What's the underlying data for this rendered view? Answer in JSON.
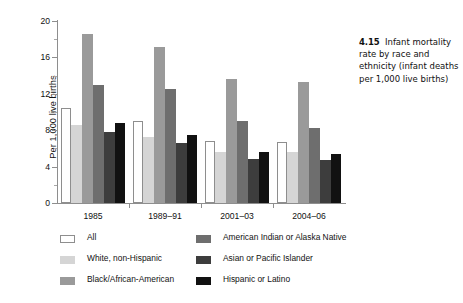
{
  "caption": {
    "number": "4.15",
    "text": "Infant mortality rate by race and ethnicity (infant deaths per 1,000 live births)"
  },
  "axis": {
    "ylabel": "Per 1,000 live births",
    "yticks": [
      "0",
      "4",
      "8",
      "12",
      "16",
      "20"
    ]
  },
  "legend": {
    "items": [
      {
        "label": "All",
        "color": "#ffffff"
      },
      {
        "label": "White, non-Hispanic",
        "color": "#d5d5d5"
      },
      {
        "label": "Black/African-American",
        "color": "#9a9a9a"
      },
      {
        "label": "American Indian or Alaska Native",
        "color": "#6e6e6e"
      },
      {
        "label": "Asian or Pacific Islander",
        "color": "#3d3d3d"
      },
      {
        "label": "Hispanic or Latino",
        "color": "#111111"
      }
    ]
  },
  "chart_data": {
    "type": "bar",
    "title": "Infant mortality rate by race and ethnicity (infant deaths per 1,000 live births)",
    "xlabel": "",
    "ylabel": "Per 1,000 live births",
    "ylim": [
      0,
      20
    ],
    "ytick_step": 4,
    "grid": false,
    "legend_position": "below-plot",
    "categories": [
      "1985",
      "1989–91",
      "2001–03",
      "2004–06"
    ],
    "series": [
      {
        "name": "All",
        "color": "#ffffff",
        "values": [
          10.4,
          9.0,
          6.8,
          6.7
        ]
      },
      {
        "name": "White, non-Hispanic",
        "color": "#d5d5d5",
        "values": [
          8.6,
          7.3,
          5.6,
          5.6
        ]
      },
      {
        "name": "Black/African-American",
        "color": "#9a9a9a",
        "values": [
          18.6,
          17.1,
          13.6,
          13.3
        ]
      },
      {
        "name": "American Indian or Alaska Native",
        "color": "#6e6e6e",
        "values": [
          13.0,
          12.5,
          9.0,
          8.2
        ]
      },
      {
        "name": "Asian or Pacific Islander",
        "color": "#3d3d3d",
        "values": [
          7.8,
          6.6,
          4.8,
          4.7
        ]
      },
      {
        "name": "Hispanic or Latino",
        "color": "#111111",
        "values": [
          8.8,
          7.5,
          5.6,
          5.4
        ]
      }
    ]
  }
}
